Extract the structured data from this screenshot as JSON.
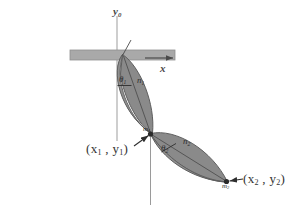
{
  "figure": {
    "background_color": "#ffffff",
    "link_fill_color": "#8a8a8a",
    "link_stroke_color": "#5c5c5c",
    "support_color": "#a9a9a9",
    "support_stroke_color": "#8f8f8f",
    "axis_color": "#9a9a9a",
    "text_color": "#333333"
  },
  "axes": {
    "y_axis_label": "y",
    "y_axis_subscript": "0",
    "x_axis_label": "x",
    "origin_x": 117,
    "origin_y": 55
  },
  "support": {
    "name": "fixed-support-bar",
    "x": 70,
    "y": 50,
    "width": 105,
    "height": 10
  },
  "links": [
    {
      "id": "link-1",
      "angle_label": "θ",
      "angle_subscript": "1",
      "normal_label": "n",
      "normal_subscript": "1",
      "pivot_x": 122,
      "pivot_y": 55,
      "end_x": 150,
      "end_y": 134
    },
    {
      "id": "link-2",
      "angle_label": "θ",
      "angle_subscript": "2",
      "normal_label": "n",
      "normal_subscript": "2",
      "pivot_x": 150,
      "pivot_y": 134,
      "end_x": 227,
      "end_y": 182
    }
  ],
  "annotations": [
    {
      "id": "joint-1-coordinate",
      "text_prefix": "(x",
      "sub_1": "1",
      "text_middle": " , y",
      "sub_2": "1",
      "text_suffix": ")",
      "label_x": 86,
      "label_y": 142
    },
    {
      "id": "endpoint-2-coordinate",
      "text_prefix": "(x",
      "sub_1": "2",
      "text_middle": " , y",
      "sub_2": "2",
      "text_suffix": ")",
      "label_x": 243,
      "label_y": 179
    }
  ],
  "marker_labels": {
    "joint_marker": "m",
    "joint_marker_subscript": "1",
    "endpoint_marker": "m",
    "endpoint_marker_subscript": "2"
  }
}
